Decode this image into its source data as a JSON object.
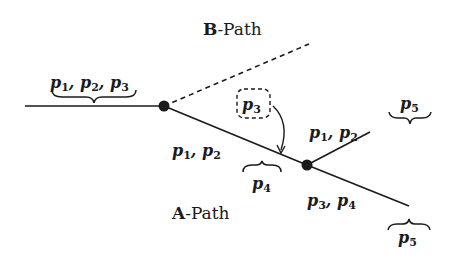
{
  "diagram": {
    "b_path_label": {
      "bold": "B",
      "rest": "-Path"
    },
    "a_path_label": {
      "bold": "A",
      "rest": "-Path"
    },
    "incoming_label": {
      "parts": [
        {
          "base": "p",
          "sub": "1"
        },
        {
          "sep": ", "
        },
        {
          "base": "p",
          "sub": "2"
        },
        {
          "sep": ", "
        },
        {
          "base": "p",
          "sub": "3"
        }
      ],
      "text": "p1, p2, p3"
    },
    "segment_a1_label": {
      "text": "p1, p2",
      "p1": "1",
      "p2": "2"
    },
    "boxed_label": {
      "text": "p3",
      "sub": "3"
    },
    "segment_a1_brace_label": {
      "text": "p4",
      "sub": "4"
    },
    "upper_branch_label": {
      "text": "p1, p2",
      "p1": "1",
      "p2": "2"
    },
    "upper_branch_brace_label": {
      "text": "p5",
      "sub": "5"
    },
    "lower_branch_label": {
      "text": "p3, p4",
      "p3": "3",
      "p4": "4"
    },
    "lower_branch_brace_label": {
      "text": "p5",
      "sub": "5"
    },
    "colors": {
      "ink": "#1a1a1a",
      "background": "#ffffff"
    }
  }
}
